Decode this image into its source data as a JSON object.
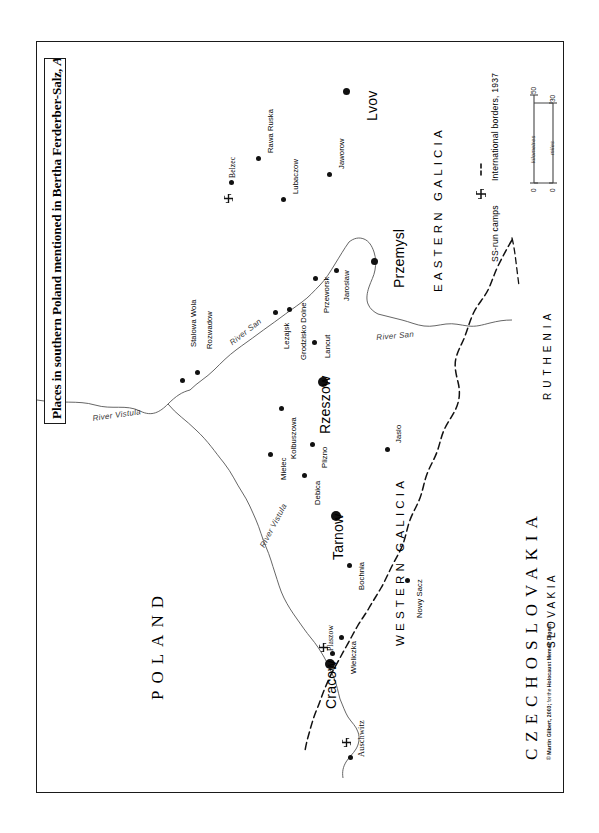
{
  "document": {
    "title_main": "Places in southern Poland mentioned in Bertha Ferderber-Salz,",
    "title_italic": "And the Sun Kept Shining...",
    "credit": "© Martin Gilbert, 2003; for the Holocaust Memoir Digest",
    "credit_bold_lead": "© Martin Gilbert, 2003;",
    "credit_small": " for the ",
    "credit_bold_tail": "Holocaust Memoir Digest"
  },
  "legend": {
    "border_entry": "International borders, 1937",
    "camp_entry": "SS-run camps",
    "border_icon": "dashed-line-icon",
    "camp_icon": "swastika-icon",
    "scale": {
      "km_label": "kilometres",
      "km_min": "0",
      "km_max": "50",
      "mi_label": "miles",
      "mi_min": "0",
      "mi_max": "30"
    }
  },
  "countries": [
    {
      "name": "POLAND",
      "x": 148,
      "y": 700,
      "size": "country"
    },
    {
      "name": "CZECHOSLOVAKIA",
      "x": 520,
      "y": 750,
      "size": "country"
    },
    {
      "name": "SLOVAKIA",
      "x": 544,
      "y": 640,
      "size": "subregion"
    },
    {
      "name": "RUTHENIA",
      "x": 540,
      "y": 400,
      "size": "subregion"
    }
  ],
  "regions": [
    {
      "name": "EASTERN GALICIA",
      "x": 432,
      "y": 290
    },
    {
      "name": "WESTERN GALICIA",
      "x": 392,
      "y": 640
    }
  ],
  "rivers": [
    {
      "name": "River Vistula",
      "x": 100,
      "y": 416,
      "rot": -8
    },
    {
      "name": "River Vistula",
      "x": 262,
      "y": 540,
      "rot": -62
    },
    {
      "name": "River San",
      "x": 232,
      "y": 336,
      "rot": -38
    },
    {
      "name": "River San",
      "x": 378,
      "y": 333,
      "rot": -4
    }
  ],
  "places": [
    {
      "name": "Lvov",
      "dot_x": 343,
      "dot_y": 88,
      "size": "md",
      "lx": 364,
      "ly": 120,
      "label_size": "major",
      "camp": false
    },
    {
      "name": "Rawa Ruska",
      "dot_x": 256,
      "dot_y": 156,
      "size": "sm",
      "lx": 266,
      "ly": 152,
      "label_size": "small",
      "camp": false
    },
    {
      "name": "Belzec",
      "dot_x": 229,
      "dot_y": 182,
      "size": "sm",
      "lx": 229,
      "ly": 178,
      "label_size": "small",
      "camp": true,
      "camp_x": 225,
      "camp_y": 193
    },
    {
      "name": "Lubaczow",
      "dot_x": 281,
      "dot_y": 197,
      "size": "sm",
      "lx": 290,
      "ly": 193,
      "label_size": "small",
      "camp": false
    },
    {
      "name": "Jaworow",
      "dot_x": 327,
      "dot_y": 172,
      "size": "sm",
      "lx": 336,
      "ly": 168,
      "label_size": "small",
      "camp": false
    },
    {
      "name": "Przemysl",
      "dot_x": 371,
      "dot_y": 258,
      "size": "md",
      "lx": 390,
      "ly": 287,
      "label_size": "major",
      "camp": false
    },
    {
      "name": "Jaroslaw",
      "dot_x": 334,
      "dot_y": 268,
      "size": "sm",
      "lx": 340,
      "ly": 300,
      "label_size": "small",
      "camp": false
    },
    {
      "name": "Przeworsk",
      "dot_x": 313,
      "dot_y": 276,
      "size": "sm",
      "lx": 320,
      "ly": 311,
      "label_size": "small",
      "camp": false
    },
    {
      "name": "Grodzisko Dolne",
      "dot_x": 287,
      "dot_y": 307,
      "size": "sm",
      "lx": 297,
      "ly": 358,
      "label_size": "small",
      "camp": false
    },
    {
      "name": "Lezajsk",
      "dot_x": 273,
      "dot_y": 310,
      "size": "sm",
      "lx": 280,
      "ly": 347,
      "label_size": "small",
      "camp": false
    },
    {
      "name": "Lancut",
      "dot_x": 312,
      "dot_y": 340,
      "size": "sm",
      "lx": 321,
      "ly": 356,
      "label_size": "small",
      "camp": false
    },
    {
      "name": "Rozwadow",
      "dot_x": 195,
      "dot_y": 370,
      "size": "sm",
      "lx": 203,
      "ly": 347,
      "label_size": "small",
      "camp": false
    },
    {
      "name": "Stalowa Wola",
      "dot_x": 180,
      "dot_y": 378,
      "size": "sm",
      "lx": 187,
      "ly": 345,
      "label_size": "small",
      "camp": false
    },
    {
      "name": "Rzeszow",
      "dot_x": 320,
      "dot_y": 379,
      "size": "lg",
      "lx": 316,
      "ly": 433,
      "label_size": "major",
      "camp": false
    },
    {
      "name": "Kolbuszowa",
      "dot_x": 279,
      "dot_y": 406,
      "size": "sm",
      "lx": 287,
      "ly": 457,
      "label_size": "small",
      "camp": false
    },
    {
      "name": "Jaslo",
      "dot_x": 385,
      "dot_y": 447,
      "size": "sm",
      "lx": 392,
      "ly": 442,
      "label_size": "small",
      "camp": false
    },
    {
      "name": "Plizno",
      "dot_x": 310,
      "dot_y": 442,
      "size": "sm",
      "lx": 318,
      "ly": 466,
      "label_size": "small",
      "camp": false
    },
    {
      "name": "Mielec",
      "dot_x": 268,
      "dot_y": 452,
      "size": "sm",
      "lx": 277,
      "ly": 478,
      "label_size": "small",
      "camp": false
    },
    {
      "name": "Debica",
      "dot_x": 302,
      "dot_y": 473,
      "size": "sm",
      "lx": 311,
      "ly": 503,
      "label_size": "small",
      "camp": false
    },
    {
      "name": "Tarnow",
      "dot_x": 333,
      "dot_y": 513,
      "size": "lg",
      "lx": 329,
      "ly": 558,
      "label_size": "major",
      "camp": false
    },
    {
      "name": "Bochnia",
      "dot_x": 347,
      "dot_y": 563,
      "size": "sm",
      "lx": 355,
      "ly": 588,
      "label_size": "small",
      "camp": false
    },
    {
      "name": "Nowy Sacz",
      "dot_x": 405,
      "dot_y": 578,
      "size": "sm",
      "lx": 413,
      "ly": 616,
      "label_size": "small",
      "camp": false
    },
    {
      "name": "Wieliczka",
      "dot_x": 339,
      "dot_y": 635,
      "size": "sm",
      "lx": 347,
      "ly": 672,
      "label_size": "small",
      "camp": false
    },
    {
      "name": "Plaszow",
      "dot_x": 330,
      "dot_y": 648,
      "size": "sm",
      "lx": 325,
      "ly": 649,
      "label_size": "small",
      "camp": true,
      "camp_x": 320,
      "camp_y": 645
    },
    {
      "name": "Cracow",
      "dot_x": 327,
      "dot_y": 661,
      "size": "lg",
      "lx": 322,
      "ly": 707,
      "label_size": "major",
      "camp": false
    },
    {
      "name": "Auschwitz",
      "dot_x": 348,
      "dot_y": 753,
      "size": "sm",
      "lx": 355,
      "ly": 755,
      "label_size": "small",
      "camp": true,
      "camp_x": 343,
      "camp_y": 739
    }
  ]
}
